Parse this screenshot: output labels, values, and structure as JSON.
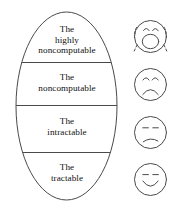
{
  "figure": {
    "name": "computability-hierarchy-diagram",
    "background_color": "#ffffff",
    "stroke_color": "#444444",
    "text_color": "#111111",
    "bands": [
      {
        "id": "highly-noncomputable",
        "lines": [
          "The",
          "highly",
          "noncomputable"
        ],
        "line1": "The",
        "line2": "highly",
        "line3": "noncomputable",
        "face": "crying-face"
      },
      {
        "id": "noncomputable",
        "lines": [
          "The",
          "noncomputable"
        ],
        "line1": "The",
        "line2": "noncomputable",
        "line3": "",
        "face": "frowning-face"
      },
      {
        "id": "intractable",
        "lines": [
          "The",
          "intractable"
        ],
        "line1": "The",
        "line2": "intractable",
        "line3": "",
        "face": "unhappy-face"
      },
      {
        "id": "tractable",
        "lines": [
          "The",
          "tractable"
        ],
        "line1": "The",
        "line2": "tractable",
        "line3": "",
        "face": "smiling-face"
      }
    ],
    "faces": [
      {
        "id": "crying-face",
        "label": "crying face with tears and open mouth"
      },
      {
        "id": "frowning-face",
        "label": "frowning sad face"
      },
      {
        "id": "unhappy-face",
        "label": "slightly unhappy face"
      },
      {
        "id": "smiling-face",
        "label": "smiling happy face"
      }
    ]
  }
}
